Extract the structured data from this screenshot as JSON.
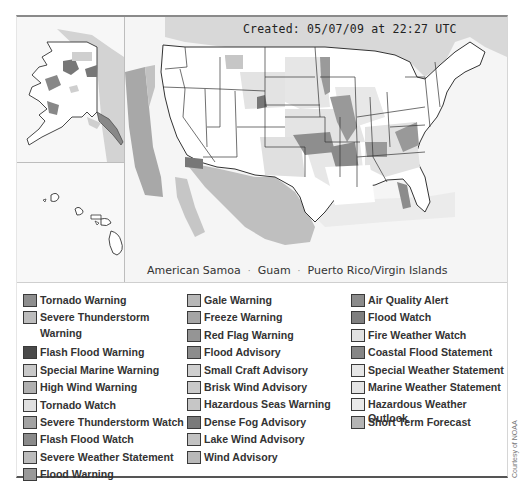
{
  "map": {
    "created_label": "Created: 05/07/09 at 22:27 UTC",
    "insets": [
      "Alaska",
      "Hawaii"
    ],
    "territories": [
      {
        "label": "American Samoa"
      },
      {
        "label": "Guam"
      },
      {
        "label": "Puerto Rico/Virgin Islands"
      }
    ],
    "territory_separator": "·"
  },
  "legend": {
    "columns": [
      {
        "items": [
          {
            "label": "Tornado Warning",
            "color": "#8e8e8e"
          },
          {
            "label": "Severe Thunderstorm Warning",
            "color": "#bdbdbd",
            "wrap": true
          },
          {
            "label": "Flash Flood Warning",
            "color": "#4a4a4a"
          },
          {
            "label": "Special Marine Warning",
            "color": "#c8c8c8"
          },
          {
            "label": "High Wind Warning",
            "color": "#b0b0b0"
          },
          {
            "label": "Tornado Watch",
            "color": "#e0e0e0"
          },
          {
            "label": "Severe Thunderstorm Watch",
            "color": "#a2a2a2"
          },
          {
            "label": "Flash Flood Watch",
            "color": "#8a8a8a"
          },
          {
            "label": "Severe Weather Statement",
            "color": "#bcbcbc"
          },
          {
            "label": "Flood Warning",
            "color": "#999999"
          }
        ]
      },
      {
        "items": [
          {
            "label": "Gale Warning",
            "color": "#b8b8b8"
          },
          {
            "label": "Freeze Warning",
            "color": "#a5a5a5"
          },
          {
            "label": "Red Flag Warning",
            "color": "#959595"
          },
          {
            "label": "Flood Advisory",
            "color": "#8c8c8c"
          },
          {
            "label": "Small Craft Advisory",
            "color": "#cfcfcf"
          },
          {
            "label": "Brisk Wind Advisory",
            "color": "#c9c9c9"
          },
          {
            "label": "Hazardous Seas Warning",
            "color": "#c6c6c6"
          },
          {
            "label": "Dense Fog Advisory",
            "color": "#7a7a7a"
          },
          {
            "label": "Lake Wind Advisory",
            "color": "#c2c2c2"
          },
          {
            "label": "Wind Advisory",
            "color": "#b9b9b9"
          }
        ]
      },
      {
        "items": [
          {
            "label": "Air Quality Alert",
            "color": "#8b8b8b"
          },
          {
            "label": "Flood Watch",
            "color": "#7f7f7f"
          },
          {
            "label": "Fire Weather Watch",
            "color": "#e2e2e2"
          },
          {
            "label": "Coastal Flood Statement",
            "color": "#868686"
          },
          {
            "label": "Special Weather Statement",
            "color": "#e6e6e6"
          },
          {
            "label": "Marine Weather Statement",
            "color": "#e4e4e4"
          },
          {
            "label": "Hazardous Weather Outlook",
            "color": "#e9e9e9"
          },
          {
            "label": "Short Term Forecast",
            "color": "#b4b4b4"
          }
        ]
      }
    ]
  },
  "credit": "Courtesy of NOAA",
  "colors": {
    "state_fill": "#ffffff",
    "state_border": "#333333",
    "ocean": "#f4f4f4",
    "canada_mexico": "#d6d6d6",
    "marine_zone": "#a8a8a8"
  }
}
